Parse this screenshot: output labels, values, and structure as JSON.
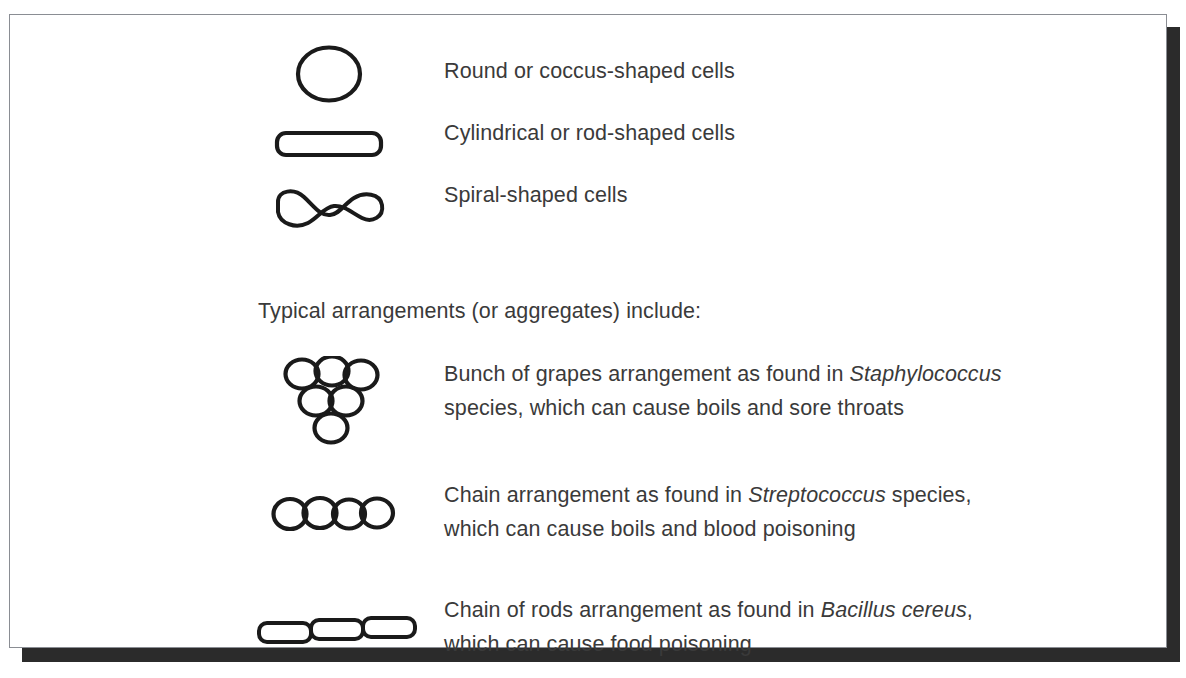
{
  "figure": {
    "cutoff_title": "",
    "border_color": "#8a8d93",
    "shadow_color": "#2b2b2b",
    "text_color": "#3a3a3a",
    "background_color": "#ffffff",
    "ink_color": "#1a1a1a"
  },
  "cell_shapes": {
    "rows": [
      {
        "icon": "circle-cell-icon",
        "label": "Round or coccus-shaped cells"
      },
      {
        "icon": "rod-cell-icon",
        "label": "Cylindrical or rod-shaped cells"
      },
      {
        "icon": "spiral-cell-icon",
        "label": "Spiral-shaped cells"
      }
    ]
  },
  "arrangements": {
    "heading": "Typical arrangements (or aggregates) include:",
    "rows": [
      {
        "icon": "grape-cluster-icon",
        "line1_before": "Bunch of grapes arrangement as found in ",
        "line1_species": "Staphylococcus",
        "line1_after": "",
        "line2": "species, which can cause boils and sore throats"
      },
      {
        "icon": "cocci-chain-icon",
        "line1_before": "Chain arrangement as found in ",
        "line1_species": "Streptococcus",
        "line1_after": " species,",
        "line2": "which can cause boils and blood poisoning"
      },
      {
        "icon": "rod-chain-icon",
        "line1_before": "Chain of rods arrangement as found in ",
        "line1_species": "Bacillus cereus",
        "line1_after": ",",
        "line2": "which can cause food poisoning"
      }
    ]
  }
}
